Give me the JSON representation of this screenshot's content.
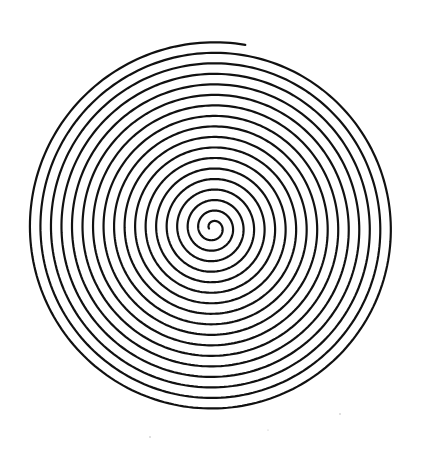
{
  "image": {
    "subject": "Archimedean spiral line drawing",
    "background_color": "#ffffff",
    "stroke_color": "#111111",
    "stroke_width": 2.2,
    "center": [
      213,
      228
    ],
    "outer_radius": 186,
    "inner_radius": 4,
    "turns": 17.3,
    "start_angle_deg": 0,
    "end_angle_deg": -80,
    "direction": "clockwise-outward"
  }
}
